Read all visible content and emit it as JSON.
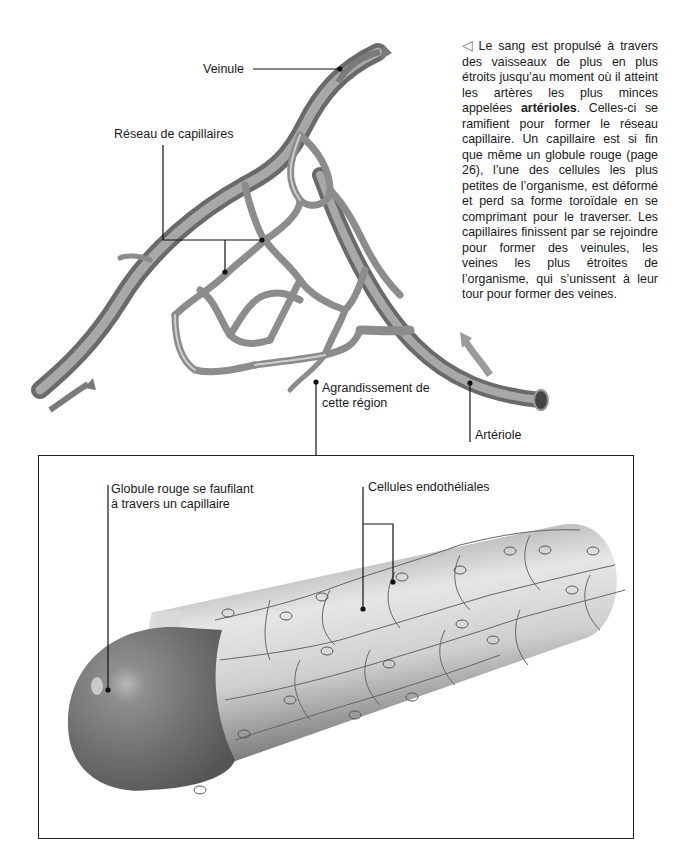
{
  "caption": {
    "icon": "left-triangle-icon",
    "icon_glyph": "◁",
    "text_before_bold": "Le sang est propulsé à travers des vaisseaux de plus en plus étroits jusqu’au moment où il atteint les artères les plus minces appelées ",
    "bold_term": "artérioles",
    "text_after_bold": ". Celles-ci se ramifient pour former le réseau capillaire. Un capillaire est si fin que même un globule rouge (page 26), l’une des cellules les plus petites de l’organisme, est déformé et perd sa forme toroïdale en se comprimant pour le traverser. Les capillaires finissent par se rejoindre pour former des veinules, les veines les plus étroites de l’organisme, qui s’unissent à leur tour pour former des veines."
  },
  "overview_labels": {
    "veinule": "Veinule",
    "capillary_network": "Réseau de capillaires",
    "enlargement_line1": "Agrandissement de",
    "enlargement_line2": "cette région",
    "arteriole": "Artériole"
  },
  "inset_labels": {
    "red_cell_line1": "Globule rouge se faufilant",
    "red_cell_line2": "à travers un capillaire",
    "endothelial": "Cellules endothéliales"
  },
  "colors": {
    "vessel": "#8a8a8a",
    "vessel_dark": "#5e5e5e",
    "vessel_light": "#c4c4c4",
    "arrow": "#7a7a7a",
    "leader_line": "#111111",
    "frame": "#222222"
  }
}
